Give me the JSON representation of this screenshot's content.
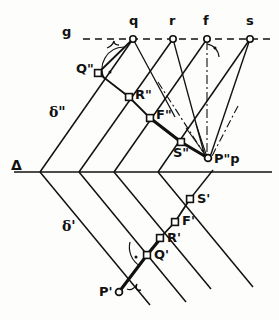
{
  "figure": {
    "type": "line-diagram",
    "canvas": {
      "width": 279,
      "height": 320,
      "background": "#fdfdfb"
    },
    "stroke_color": "#111111",
    "ground_line_label": "g",
    "trace_line_label": "Δ"
  },
  "labels": {
    "g": "g",
    "q": "q",
    "r": "r",
    "f": "f",
    "s": "s",
    "delta_double": "δ\"",
    "delta_single": "δ'",
    "triangle": "Δ",
    "Q_double": "Q\"",
    "R_double": "R\"",
    "F_double": "F\"",
    "S_double": "S\"",
    "Pp_double": "P\"p",
    "S_single": "S'",
    "F_single": "F'",
    "R_single": "R'",
    "Q_single": "Q'",
    "P_single": "P'"
  },
  "points": {
    "q": {
      "x": 133,
      "y": 39,
      "label": "q",
      "marker": "circle"
    },
    "r": {
      "x": 173,
      "y": 39,
      "label": "r",
      "marker": "circle"
    },
    "f": {
      "x": 207,
      "y": 39,
      "label": "f",
      "marker": "circle"
    },
    "s": {
      "x": 250,
      "y": 39,
      "label": "s",
      "marker": "circle"
    },
    "Q_double": {
      "x": 98,
      "y": 73,
      "label": "Q\"",
      "marker": "square"
    },
    "R_double": {
      "x": 129,
      "y": 97,
      "label": "R\"",
      "marker": "square"
    },
    "F_double": {
      "x": 150,
      "y": 118,
      "label": "F\"",
      "marker": "square"
    },
    "S_double": {
      "x": 181,
      "y": 142,
      "label": "S\"",
      "marker": "square"
    },
    "Pp_double": {
      "x": 208,
      "y": 158,
      "label": "P\"p",
      "marker": "circle"
    },
    "S_single": {
      "x": 190,
      "y": 199,
      "label": "S'",
      "marker": "square"
    },
    "F_single": {
      "x": 175,
      "y": 222,
      "label": "F'",
      "marker": "square"
    },
    "R_single": {
      "x": 160,
      "y": 238,
      "label": "R'",
      "marker": "square"
    },
    "Q_single": {
      "x": 147,
      "y": 255,
      "label": "Q'",
      "marker": "square"
    },
    "P_single": {
      "x": 119,
      "y": 292,
      "label": "P'",
      "marker": "circle"
    },
    "v1": {
      "x": 40,
      "y": 172,
      "label": "",
      "marker": "none"
    },
    "v2": {
      "x": 79,
      "y": 172,
      "label": "",
      "marker": "none"
    },
    "v3": {
      "x": 114,
      "y": 172,
      "label": "",
      "marker": "none"
    },
    "v4": {
      "x": 158,
      "y": 172,
      "label": "",
      "marker": "none"
    }
  },
  "lines": {
    "ground_line": {
      "x1": 83,
      "y1": 39,
      "x2": 272,
      "y2": 39,
      "style": "dashed"
    },
    "trace_line": {
      "x1": 14,
      "y1": 172,
      "x2": 272,
      "y2": 172,
      "style": "solid"
    },
    "vertical_f": {
      "x1": 207,
      "y1": 39,
      "x2": 207,
      "y2": 158,
      "style": "dashdot"
    }
  },
  "annotations": {
    "right_angle_marks": 4,
    "arc_marks": 3,
    "brace_marks": 2
  }
}
